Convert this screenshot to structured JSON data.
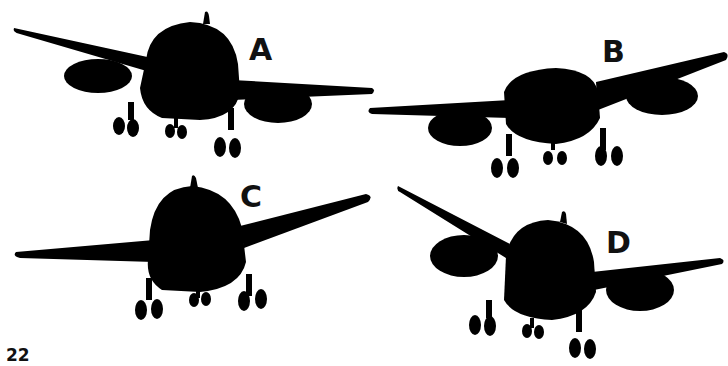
{
  "figure": {
    "options": [
      {
        "id": "A",
        "label": "A",
        "description": "aircraft silhouette, front view, wings level-ish, left wing raised, engine pods under both wings"
      },
      {
        "id": "B",
        "label": "B",
        "description": "aircraft silhouette, front view, right wing raised, engine pods under both wings"
      },
      {
        "id": "C",
        "label": "C",
        "description": "aircraft silhouette, front view, no engine pods, right wing raised"
      },
      {
        "id": "D",
        "label": "D",
        "description": "aircraft silhouette, front view, left wing steeply raised, engine pods under both wings"
      }
    ],
    "colors": {
      "silhouette": "#000000",
      "background": "#ffffff",
      "text": "#111111"
    }
  },
  "page": {
    "number": "22"
  }
}
